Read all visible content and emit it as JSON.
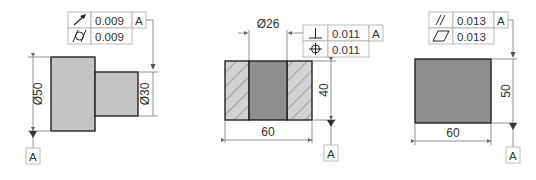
{
  "colors": {
    "light_fill": "#c4c4c4",
    "dark_fill": "#8e8e8e",
    "hatch_fill": "#d2d2d2",
    "outline": "#222222",
    "dim_line": "#777777"
  },
  "figures": [
    {
      "name": "stepped-shaft",
      "fcf": [
        {
          "symbol": "circular-runout",
          "tolerance": "0.009",
          "datum": "A"
        },
        {
          "symbol": "cylindricity",
          "tolerance": "0.009",
          "datum": ""
        }
      ],
      "dimensions": {
        "large_diameter": "Ø50",
        "small_diameter": "Ø30"
      },
      "datum_label": "A"
    },
    {
      "name": "bored-block-section",
      "fcf": [
        {
          "symbol": "perpendicularity",
          "tolerance": "0.011",
          "datum": "A"
        },
        {
          "symbol": "position",
          "tolerance": "0.011",
          "datum": ""
        }
      ],
      "dimensions": {
        "bore_diameter": "Ø26",
        "height": "40",
        "width": "60"
      },
      "datum_label": "A"
    },
    {
      "name": "rectangular-block",
      "fcf": [
        {
          "symbol": "parallelism",
          "tolerance": "0.013",
          "datum": "A"
        },
        {
          "symbol": "flatness",
          "tolerance": "0.013",
          "datum": ""
        }
      ],
      "dimensions": {
        "height": "50",
        "width": "60"
      },
      "datum_label": "A"
    }
  ]
}
